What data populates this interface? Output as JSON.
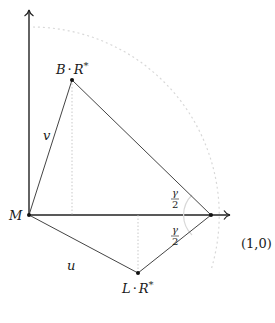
{
  "diagram": {
    "points": {
      "M": {
        "label": "M",
        "x": 29,
        "y": 215
      },
      "B": {
        "label_main": "B",
        "label_dot": "·",
        "label_R": "R",
        "label_star": "*",
        "x": 72,
        "y": 80
      },
      "L": {
        "label_main": "L",
        "label_dot": "·",
        "label_R": "R",
        "label_star": "*",
        "x": 138,
        "y": 273
      },
      "P": {
        "label": "(1,0)",
        "x": 211,
        "y": 215
      }
    },
    "edge_labels": {
      "v": "v",
      "u": "u"
    },
    "angle_labels": {
      "upper_num": "γ",
      "upper_den": "2",
      "lower_num": "γ",
      "lower_den": "2"
    },
    "colors": {
      "axis": "#222222",
      "edge": "#444444",
      "dotted": "#bbbbbb",
      "circle": "#dddddd",
      "arc": "#dddddd"
    }
  }
}
